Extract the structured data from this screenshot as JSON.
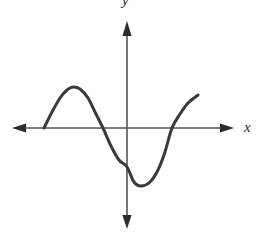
{
  "figure": {
    "background_color": "#ffffff",
    "width": 266,
    "height": 233
  },
  "axes": {
    "x_axis": {
      "label": "x",
      "color": "#555555",
      "origin_y": 128,
      "start_x": 12,
      "end_x": 233,
      "arrow_left": "arrow-left",
      "arrow_right": "arrow-right"
    },
    "y_axis": {
      "label": "y",
      "color": "#555555",
      "origin_x": 127,
      "start_y": 22,
      "end_y": 227,
      "arrow_up": "arrow-up",
      "arrow_down": "arrow-down"
    },
    "origin": {
      "x": 127,
      "y": 128
    }
  },
  "chart_data": {
    "type": "line",
    "title": "",
    "xlabel": "x",
    "ylabel": "y",
    "grid": false,
    "legend": null,
    "axis_style": "two-sided-arrows",
    "curve_color": "#3a3a3a",
    "curve_width": 3,
    "features": {
      "left_endpoint": {
        "x": 44,
        "y": 128
      },
      "local_maximum": {
        "x": 73,
        "y": 87
      },
      "x_intercept_left": {
        "x": 103,
        "y": 128
      },
      "y_intercept": {
        "x": 127,
        "y": 167
      },
      "local_minimum": {
        "x": 137,
        "y": 186
      },
      "x_intercept_right": {
        "x": 172,
        "y": 128
      },
      "right_endpoint": {
        "x": 198,
        "y": 95
      }
    },
    "x": [
      44,
      52,
      60,
      67,
      73,
      80,
      88,
      95,
      103,
      111,
      119,
      127,
      134,
      141,
      150,
      158,
      165,
      172,
      180,
      188,
      198
    ],
    "y": [
      128,
      112,
      98,
      90,
      87,
      89,
      98,
      112,
      128,
      146,
      160,
      167,
      182,
      186,
      182,
      170,
      152,
      128,
      114,
      103,
      95
    ]
  }
}
